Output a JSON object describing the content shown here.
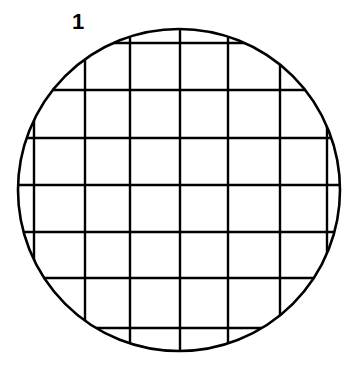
{
  "figure": {
    "label": "1",
    "label_position": {
      "x": 72,
      "y": 11
    },
    "caption": "",
    "background_color": "#ffffff",
    "stroke_color": "#000000",
    "circle": {
      "name": "petri-dish-outline",
      "center_x": 179,
      "center_y": 190,
      "radius": 161,
      "stroke_width": 2.6,
      "fill": "none"
    },
    "grid": {
      "name": "counting-grid",
      "stroke_width": 2.4,
      "clipped_to_circle": true,
      "vertical_line_x": [
        34,
        85,
        130,
        180,
        228,
        280,
        327
      ],
      "horizontal_line_y": [
        43,
        90,
        138,
        185,
        232,
        278,
        328
      ],
      "vertical_count": 7,
      "horizontal_count": 7
    }
  }
}
